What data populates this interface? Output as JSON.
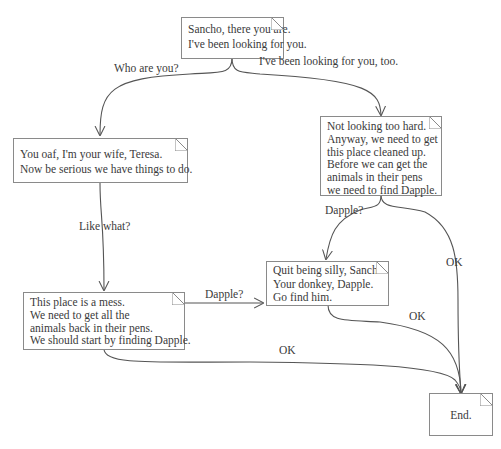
{
  "diagram": {
    "type": "dialogue-flowchart",
    "nodes": [
      {
        "id": "start",
        "lines": [
          "Sancho, there you are.",
          "I've been looking for you."
        ]
      },
      {
        "id": "wife",
        "lines": [
          "You oaf, I'm your wife, Teresa.",
          "Now be serious we have things to do."
        ]
      },
      {
        "id": "not_hard",
        "lines": [
          "Not looking too hard.",
          "Anyway, we need to get",
          "this place cleaned up.",
          "Before we can get the",
          "animals in their pens",
          "we need to find Dapple."
        ]
      },
      {
        "id": "mess",
        "lines": [
          "This place is a mess.",
          "We need to get all the",
          "animals back in their pens.",
          "We should start by finding Dapple."
        ]
      },
      {
        "id": "silly",
        "lines": [
          "Quit being silly, Sancho.",
          "Your donkey, Dapple.",
          "Go find him."
        ]
      },
      {
        "id": "end",
        "lines": [
          "End."
        ]
      }
    ],
    "edges": [
      {
        "from": "start",
        "to": "wife",
        "label": "Who are you?"
      },
      {
        "from": "start",
        "to": "not_hard",
        "label": "I've been looking for you, too."
      },
      {
        "from": "wife",
        "to": "mess",
        "label": "Like what?"
      },
      {
        "from": "not_hard",
        "to": "silly",
        "label": "Dapple?"
      },
      {
        "from": "not_hard",
        "to": "end",
        "label": "OK"
      },
      {
        "from": "mess",
        "to": "silly",
        "label": "Dapple?"
      },
      {
        "from": "silly",
        "to": "end",
        "label": "OK"
      },
      {
        "from": "mess",
        "to": "end",
        "label": "OK"
      }
    ]
  },
  "colors": {
    "line": "#555555",
    "border": "#8a8a8a",
    "text": "#3a3a3a",
    "background": "#ffffff"
  }
}
